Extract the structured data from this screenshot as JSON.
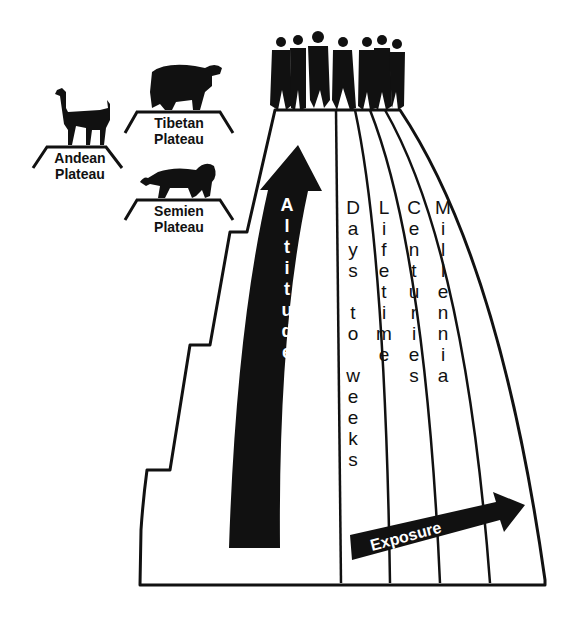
{
  "diagram": {
    "plateaus": [
      {
        "id": "andean",
        "label_line1": "Andean",
        "label_line2": "Plateau",
        "animal": "llama"
      },
      {
        "id": "tibetan",
        "label_line1": "Tibetan",
        "label_line2": "Plateau",
        "animal": "yak"
      },
      {
        "id": "semien",
        "label_line1": "Semien",
        "label_line2": "Plateau",
        "animal": "gelada-lion"
      }
    ],
    "summit": {
      "figure": "group-of-people"
    },
    "axes": {
      "altitude": {
        "label": "A\nl\nt\ni\nt\nu\nd\ne",
        "direction": "up"
      },
      "exposure": {
        "label": "Exposure",
        "direction": "right"
      }
    },
    "exposure_bands": [
      {
        "label": "D\na\ny\ns\n \nt\no\n \nw\ne\ne\nk\ns",
        "text": "Days to weeks"
      },
      {
        "label": "L\ni\nf\ne\nt\ni\nm\ne",
        "text": "Lifetime"
      },
      {
        "label": "C\ne\nn\nt\nu\nr\ni\ne\ns",
        "text": "Centuries"
      },
      {
        "label": "M\ni\nl\nl\ne\nn\nn\ni\na",
        "text": "Millennia"
      }
    ],
    "colors": {
      "ink": "#111111",
      "background": "#ffffff"
    }
  }
}
